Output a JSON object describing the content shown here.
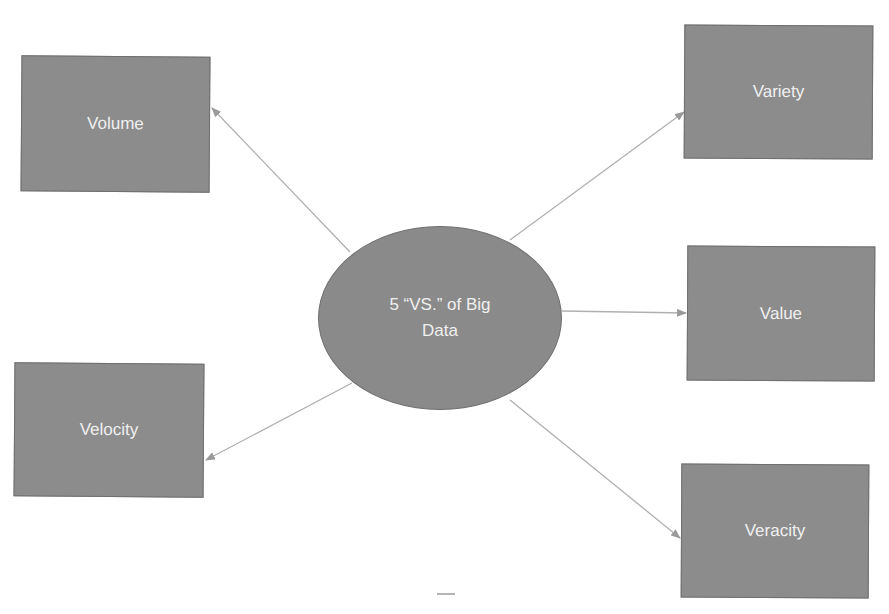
{
  "diagram": {
    "center": {
      "line1": "5 “VS.” of Big",
      "line2": "Data"
    },
    "nodes": {
      "volume": "Volume",
      "velocity": "Velocity",
      "variety": "Variety",
      "value": "Value",
      "veracity": "Veracity"
    },
    "colors": {
      "node_fill": "#8c8c8c",
      "node_border": "#6f6f6f",
      "text": "#f0f0f0",
      "arrow": "#a8a8a8"
    }
  }
}
